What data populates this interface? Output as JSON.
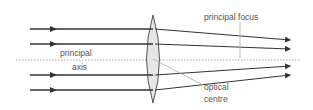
{
  "diagram": {
    "labels": {
      "principal_axis_line1": "principal",
      "principal_axis_line2": "axis",
      "principal_focus": "principal focus",
      "optical_centre_line1": "optical",
      "optical_centre_line2": "centre"
    },
    "colors": {
      "ray": "#333333",
      "lens_fill": "#e6e6e6",
      "axis": "#999999",
      "label_line": "#aaaaaa"
    },
    "rays": [
      {
        "y_in": 29,
        "y_out": 40
      },
      {
        "y_in": 44,
        "y_out": 49
      },
      {
        "y_in": 75,
        "y_out": 66
      },
      {
        "y_in": 90,
        "y_out": 75
      }
    ],
    "lens": {
      "x": 153,
      "top": 15,
      "bottom": 103
    },
    "focus": {
      "x": 240,
      "y": 60
    }
  }
}
